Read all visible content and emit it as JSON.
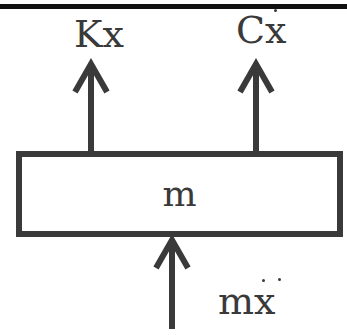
{
  "diagram": {
    "ceiling": {
      "type": "fixed-support-line"
    },
    "mass": {
      "label": "m"
    },
    "forces": [
      {
        "id": "spring",
        "label_prefix": "K",
        "label_var": "x",
        "derivative_dots": 0,
        "direction": "up"
      },
      {
        "id": "damper",
        "label_prefix": "C",
        "label_var": "x",
        "derivative_dots": 1,
        "direction": "up"
      },
      {
        "id": "inertia",
        "label_prefix": "m",
        "label_var": "x",
        "derivative_dots": 2,
        "direction": "up"
      }
    ],
    "colors": {
      "stroke": "#3a3a3a",
      "ceiling": "#111111",
      "background": "#ffffff"
    }
  }
}
